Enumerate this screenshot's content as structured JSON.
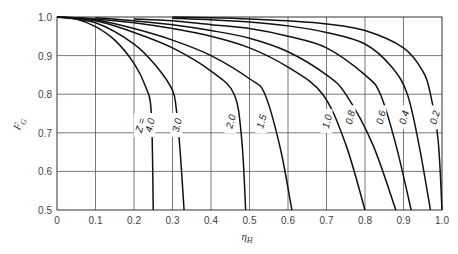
{
  "chart_data": {
    "type": "line",
    "title": "",
    "xlabel": "η_H",
    "ylabel": "F_G",
    "xlim": [
      0,
      1.0
    ],
    "ylim": [
      0.5,
      1.0
    ],
    "grid": true,
    "xticks": [
      "0",
      "0.1",
      "0.2",
      "0.3",
      "0.4",
      "0.5",
      "0.6",
      "0.7",
      "0.8",
      "0.9",
      "1.0"
    ],
    "yticks": [
      "0.5",
      "0.6",
      "0.7",
      "0.8",
      "0.9",
      "1.0"
    ],
    "legend_prefix": "Z =",
    "series": [
      {
        "name": "4.0",
        "x": [
          0.0,
          0.05,
          0.1,
          0.15,
          0.2,
          0.23,
          0.245,
          0.25
        ],
        "y": [
          1.0,
          0.995,
          0.975,
          0.94,
          0.88,
          0.82,
          0.75,
          0.5
        ],
        "label_pos": [
          0.24,
          0.72
        ]
      },
      {
        "name": "3.0",
        "x": [
          0.0,
          0.1,
          0.2,
          0.26,
          0.3,
          0.31,
          0.32,
          0.33
        ],
        "y": [
          1.0,
          0.985,
          0.93,
          0.87,
          0.81,
          0.76,
          0.65,
          0.5
        ],
        "label_pos": [
          0.31,
          0.72
        ]
      },
      {
        "name": "2.0",
        "x": [
          0.0,
          0.1,
          0.2,
          0.3,
          0.4,
          0.46,
          0.48,
          0.49
        ],
        "y": [
          1.0,
          0.99,
          0.96,
          0.92,
          0.86,
          0.8,
          0.68,
          0.5
        ],
        "label_pos": [
          0.45,
          0.73
        ]
      },
      {
        "name": "1.5",
        "x": [
          0.0,
          0.1,
          0.2,
          0.3,
          0.4,
          0.5,
          0.54,
          0.58,
          0.61
        ],
        "y": [
          1.0,
          0.993,
          0.97,
          0.94,
          0.9,
          0.84,
          0.8,
          0.66,
          0.5
        ],
        "label_pos": [
          0.53,
          0.73
        ]
      },
      {
        "name": "1.0",
        "x": [
          0.0,
          0.1,
          0.2,
          0.3,
          0.4,
          0.5,
          0.6,
          0.69,
          0.75,
          0.8
        ],
        "y": [
          1.0,
          0.995,
          0.985,
          0.97,
          0.95,
          0.92,
          0.87,
          0.8,
          0.67,
          0.5
        ],
        "label_pos": [
          0.7,
          0.73
        ]
      },
      {
        "name": "0.8",
        "x": [
          0.1,
          0.2,
          0.3,
          0.4,
          0.5,
          0.6,
          0.7,
          0.75,
          0.82,
          0.88
        ],
        "y": [
          0.998,
          0.99,
          0.98,
          0.965,
          0.945,
          0.91,
          0.85,
          0.8,
          0.67,
          0.5
        ],
        "label_pos": [
          0.76,
          0.74
        ]
      },
      {
        "name": "0.6",
        "x": [
          0.2,
          0.3,
          0.4,
          0.5,
          0.6,
          0.7,
          0.8,
          0.84,
          0.88,
          0.92
        ],
        "y": [
          0.995,
          0.99,
          0.98,
          0.97,
          0.95,
          0.92,
          0.85,
          0.8,
          0.67,
          0.5
        ],
        "label_pos": [
          0.84,
          0.74
        ]
      },
      {
        "name": "0.4",
        "x": [
          0.3,
          0.4,
          0.5,
          0.6,
          0.7,
          0.8,
          0.87,
          0.91,
          0.94,
          0.97
        ],
        "y": [
          0.997,
          0.993,
          0.987,
          0.977,
          0.96,
          0.93,
          0.87,
          0.8,
          0.67,
          0.5
        ],
        "label_pos": [
          0.9,
          0.74
        ]
      },
      {
        "name": "0.2",
        "x": [
          0.3,
          0.4,
          0.5,
          0.6,
          0.7,
          0.8,
          0.9,
          0.95,
          0.97,
          0.99,
          1.0
        ],
        "y": [
          1.0,
          0.998,
          0.995,
          0.99,
          0.982,
          0.965,
          0.92,
          0.86,
          0.8,
          0.68,
          0.5
        ],
        "label_pos": [
          0.98,
          0.74
        ]
      }
    ]
  }
}
